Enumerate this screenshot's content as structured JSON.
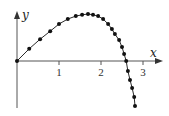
{
  "chart_data": {
    "type": "line",
    "title": "",
    "xlabel": "x",
    "ylabel": "y",
    "x_ticks": [
      "1",
      "2",
      "3"
    ],
    "xlim": [
      0,
      3.5
    ],
    "ylim": [
      -1.2,
      1.2
    ],
    "grid": false,
    "legend": null,
    "markers": true,
    "series": [
      {
        "name": "curve",
        "color": "#111111",
        "x": [
          0,
          0.29,
          0.55,
          0.79,
          1.0,
          1.21,
          1.4,
          1.55,
          1.69,
          1.81,
          1.93,
          2.05,
          2.17,
          2.26,
          2.33,
          2.43,
          2.5,
          2.55,
          2.6,
          2.64,
          2.69,
          2.74,
          2.79,
          2.81
        ],
        "y": [
          0,
          0.29,
          0.52,
          0.71,
          0.88,
          1.0,
          1.07,
          1.1,
          1.12,
          1.1,
          1.07,
          1.0,
          0.88,
          0.76,
          0.64,
          0.5,
          0.33,
          0.17,
          0,
          -0.24,
          -0.45,
          -0.64,
          -0.86,
          -1.07
        ]
      }
    ]
  },
  "layout": {
    "origin_px": [
      17,
      61
    ],
    "unit_px": 42
  }
}
